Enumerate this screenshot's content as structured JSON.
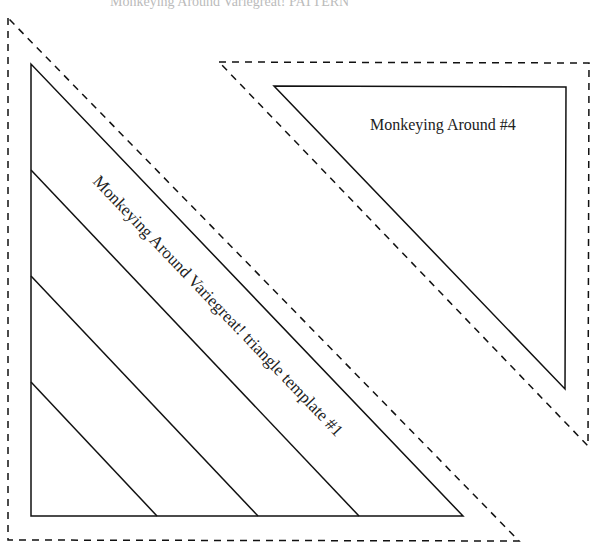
{
  "header_partial_text": "Monkeying Around Variegreat! PATTERN",
  "templates": [
    {
      "id": "template-1",
      "label": "Monkeying Around Variegreat! triangle template #1",
      "stripe_count": 3
    },
    {
      "id": "template-4",
      "label": "Monkeying Around #4"
    }
  ],
  "colors": {
    "line": "#111111",
    "text": "#222222"
  }
}
